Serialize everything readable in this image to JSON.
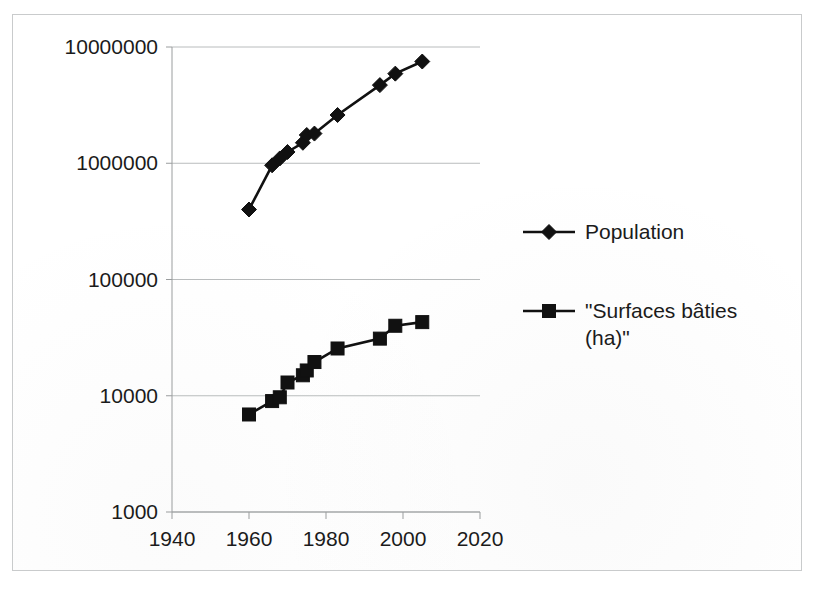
{
  "chart_data": {
    "type": "line",
    "title": "",
    "subtitle": "",
    "xlabel": "",
    "ylabel": "",
    "yscale": "log",
    "xscale": "linear",
    "xlim": [
      1940,
      2020
    ],
    "ylim": [
      1000,
      10000000
    ],
    "grid": true,
    "grid_axis": "y",
    "legend_position": "right",
    "xticks": [
      1940,
      1960,
      1980,
      2000,
      2020
    ],
    "xtick_labels": [
      "1940",
      "1960",
      "1980",
      "2000",
      "2020"
    ],
    "yticks": [
      1000,
      10000,
      100000,
      1000000,
      10000000
    ],
    "ytick_labels": [
      "1000",
      "10000",
      "100000",
      "1000000",
      "10000000"
    ],
    "series": [
      {
        "name": "Population",
        "marker": "diamond",
        "color": "#111111",
        "x": [
          1960,
          1966,
          1968,
          1970,
          1974,
          1975,
          1977,
          1983,
          1994,
          1998,
          2005
        ],
        "values": [
          400000,
          960000,
          1100000,
          1250000,
          1500000,
          1750000,
          1800000,
          2600000,
          4700000,
          5900000,
          7500000
        ]
      },
      {
        "name": "\"Surfaces bâties (ha)\"",
        "marker": "square",
        "color": "#111111",
        "x": [
          1960,
          1966,
          1968,
          1970,
          1974,
          1975,
          1977,
          1983,
          1994,
          1998,
          2005
        ],
        "values": [
          6900,
          9000,
          9700,
          13000,
          15000,
          16500,
          19500,
          25500,
          31000,
          40000,
          43000
        ]
      }
    ]
  },
  "axes": {
    "y_labels": [
      {
        "text": "10000000",
        "value": 10000000
      },
      {
        "text": "1000000",
        "value": 1000000
      },
      {
        "text": "100000",
        "value": 100000
      },
      {
        "text": "10000",
        "value": 10000
      },
      {
        "text": "1000",
        "value": 1000
      }
    ],
    "x_labels": [
      {
        "text": "1940",
        "value": 1940
      },
      {
        "text": "1960",
        "value": 1960
      },
      {
        "text": "1980",
        "value": 1980
      },
      {
        "text": "2000",
        "value": 2000
      },
      {
        "text": "2020",
        "value": 2020
      }
    ]
  },
  "legend": {
    "entries": [
      {
        "label": "Population",
        "marker": "diamond"
      },
      {
        "label": "\"Surfaces bâties (ha)\"",
        "marker": "square"
      }
    ]
  },
  "colors": {
    "series": "#111111",
    "gridline": "#b9bcbd",
    "axis": "#9a9d9e",
    "frame": "#c9cbcc",
    "text": "#1b1b1b",
    "background": "#ffffff"
  }
}
